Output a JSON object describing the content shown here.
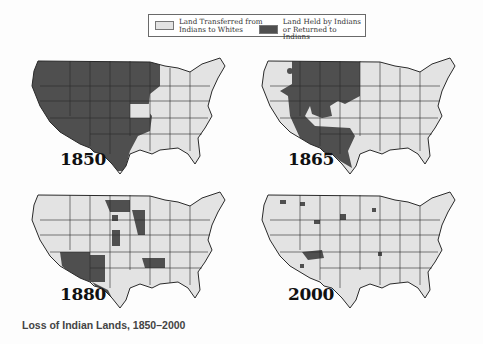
{
  "legend": {
    "items": [
      {
        "line1": "Land Transferred from",
        "line2": "Indians to Whites",
        "color": "#e3e3e3"
      },
      {
        "line1": "Land Held by Indians",
        "line2": "or Returned to Indians",
        "color": "#4f4f4f"
      }
    ]
  },
  "maps": [
    {
      "year": "1850",
      "description": "Entire West held by Indians; Mississippi valley and East transferred"
    },
    {
      "year": "1865",
      "description": "Large holdings in Great Plains and Southwest; West Coast and East transferred"
    },
    {
      "year": "1880",
      "description": "Holdings reduced to Arizona, New Mexico, Indian Territory, Dakota and scattered reservations"
    },
    {
      "year": "2000",
      "description": "Small scattered reservations, largest in Arizona/New Mexico"
    }
  ],
  "colors": {
    "transferred": "#e3e3e3",
    "held": "#4f4f4f",
    "border": "#2a2a2a"
  },
  "caption": "Loss of Indian Lands, 1850–2000"
}
